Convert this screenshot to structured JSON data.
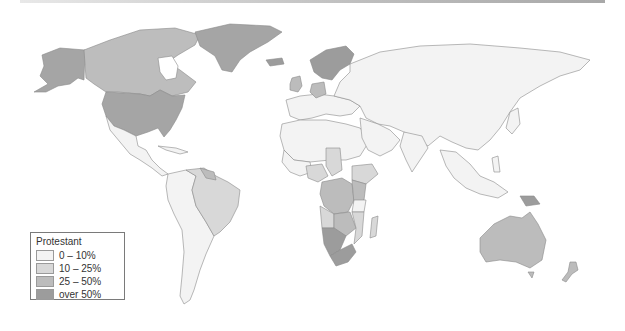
{
  "map": {
    "subject": "Protestant population share by country",
    "colors": {
      "0_10": "#f3f3f3",
      "10_25": "#d8d8d8",
      "25_50": "#bcbcbc",
      "over_50": "#9c9c9c",
      "border": "#8a8a8a",
      "ocean": "#ffffff"
    }
  },
  "legend": {
    "title": "Protestant",
    "items": [
      {
        "label": "0 – 10%",
        "color": "#f3f3f3"
      },
      {
        "label": "10 – 25%",
        "color": "#d8d8d8"
      },
      {
        "label": "25 – 50%",
        "color": "#bcbcbc"
      },
      {
        "label": "over 50%",
        "color": "#9c9c9c"
      }
    ]
  }
}
